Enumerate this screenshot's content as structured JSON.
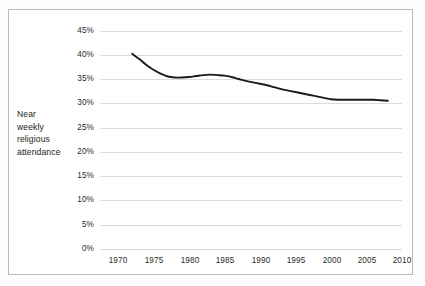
{
  "figure": {
    "axis_label_lines": [
      "Near",
      "weekly",
      "religious",
      "attendance"
    ],
    "border_color": "#b9b9b9",
    "gridline_color": "#dcdcdc",
    "line_color": "#1a1a1a",
    "background": "#ffffff"
  },
  "chart_data": {
    "type": "line",
    "title": "",
    "subtitle": "",
    "xlabel": "",
    "ylabel": "Near weekly religious attendance",
    "xlim": [
      1970,
      2010
    ],
    "ylim": [
      0,
      45
    ],
    "xticks": [
      1970,
      1975,
      1980,
      1985,
      1990,
      1995,
      2000,
      2005,
      2010
    ],
    "xticklabels": [
      "1970",
      "1975",
      "1980",
      "1985",
      "1990",
      "1995",
      "2000",
      "2005",
      "2010"
    ],
    "yticks": [
      0,
      5,
      10,
      15,
      20,
      25,
      30,
      35,
      40,
      45
    ],
    "yticklabels": [
      "0%",
      "5%",
      "10%",
      "15%",
      "20%",
      "25%",
      "30%",
      "35%",
      "40%",
      "45%"
    ],
    "grid": "horizontal",
    "legend": "none",
    "annotations": [],
    "series": [
      {
        "name": "Near weekly religious attendance",
        "x": [
          1972,
          1973,
          1974,
          1975,
          1976,
          1977,
          1978,
          1979,
          1980,
          1981,
          1982,
          1983,
          1984,
          1985,
          1986,
          1987,
          1988,
          1989,
          1990,
          1991,
          1992,
          1993,
          1994,
          1995,
          1996,
          1997,
          1998,
          1999,
          2000,
          2001,
          2002,
          2003,
          2004,
          2005,
          2006,
          2007,
          2008
        ],
        "values": [
          40.3,
          39.2,
          38.0,
          37.0,
          36.2,
          35.6,
          35.4,
          35.4,
          35.5,
          35.7,
          35.9,
          36.0,
          35.9,
          35.8,
          35.5,
          35.1,
          34.7,
          34.4,
          34.1,
          33.8,
          33.4,
          33.0,
          32.7,
          32.4,
          32.1,
          31.8,
          31.5,
          31.2,
          30.9,
          30.8,
          30.8,
          30.8,
          30.8,
          30.8,
          30.8,
          30.7,
          30.6
        ]
      }
    ]
  },
  "yticks_px": [
    {
      "label": "45%",
      "y": 31
    },
    {
      "label": "40%",
      "y": 55
    },
    {
      "label": "35%",
      "y": 79
    },
    {
      "label": "30%",
      "y": 103
    },
    {
      "label": "25%",
      "y": 128
    },
    {
      "label": "20%",
      "y": 152
    },
    {
      "label": "15%",
      "y": 176
    },
    {
      "label": "10%",
      "y": 200
    },
    {
      "label": "5%",
      "y": 225
    },
    {
      "label": "0%",
      "y": 249
    }
  ],
  "xticks_px": [
    {
      "label": "1970",
      "x": 118
    },
    {
      "label": "1975",
      "x": 154
    },
    {
      "label": "1980",
      "x": 190
    },
    {
      "label": "1985",
      "x": 225
    },
    {
      "label": "1990",
      "x": 261
    },
    {
      "label": "1995",
      "x": 296
    },
    {
      "label": "2000",
      "x": 332
    },
    {
      "label": "2005",
      "x": 367
    },
    {
      "label": "2010",
      "x": 402
    }
  ]
}
